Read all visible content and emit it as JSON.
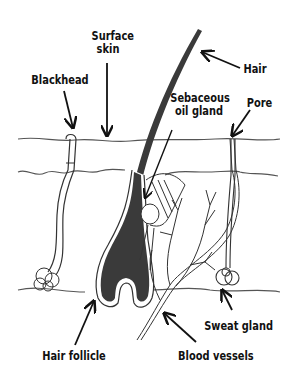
{
  "diagram": {
    "colors": {
      "ink": "#111111",
      "fill_dark": "#3a3a3a",
      "line_gray": "#555555",
      "background": "#ffffff"
    },
    "labels": {
      "surface_skin_line1": "Surface",
      "surface_skin_line2": "skin",
      "hair": "Hair",
      "blackhead": "Blackhead",
      "sebaceous_line1": "Sebaceous",
      "sebaceous_line2": "oil gland",
      "pore": "Pore",
      "sweat_gland": "Sweat gland",
      "hair_follicle": "Hair follicle",
      "blood_vessels": "Blood vessels"
    }
  }
}
